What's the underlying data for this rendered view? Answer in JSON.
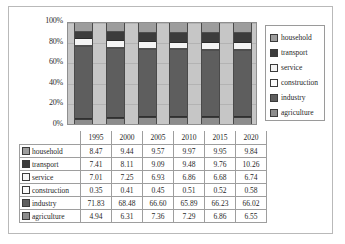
{
  "chart_data": {
    "type": "bar",
    "subtype": "100% stacked column",
    "title": "",
    "xlabel": "",
    "ylabel": "",
    "categories": [
      "1995",
      "2000",
      "2005",
      "2010",
      "2015",
      "2020"
    ],
    "ylim": [
      0,
      100
    ],
    "ytick_labels": [
      "0%",
      "20%",
      "40%",
      "60%",
      "80%",
      "100%"
    ],
    "ytick_values": [
      0,
      20,
      40,
      60,
      80,
      100
    ],
    "grid": true,
    "legend_position": "right",
    "stack_order_bottom_to_top": [
      "agriculture",
      "industry",
      "construction",
      "service",
      "transport",
      "household"
    ],
    "series": [
      {
        "name": "household",
        "color": "#9d9d9d",
        "values": [
          8.47,
          9.44,
          9.57,
          9.97,
          9.95,
          9.84
        ]
      },
      {
        "name": "transport",
        "color": "#3c3c3c",
        "values": [
          7.41,
          8.11,
          9.09,
          9.48,
          9.76,
          10.26
        ]
      },
      {
        "name": "service",
        "color": "#f4f4f4",
        "values": [
          7.01,
          7.25,
          6.93,
          6.86,
          6.68,
          6.74
        ]
      },
      {
        "name": "construction",
        "color": "#fbfbfb",
        "values": [
          0.35,
          0.41,
          0.45,
          0.51,
          0.52,
          0.58
        ]
      },
      {
        "name": "industry",
        "color": "#5e5e5e",
        "values": [
          71.83,
          68.48,
          66.6,
          65.89,
          66.23,
          66.02
        ]
      },
      {
        "name": "agriculture",
        "color": "#8c8c8c",
        "values": [
          4.94,
          6.31,
          7.36,
          7.29,
          6.86,
          6.55
        ]
      }
    ]
  },
  "legend": {
    "items": [
      {
        "label": "household",
        "color": "#9d9d9d"
      },
      {
        "label": "transport",
        "color": "#3c3c3c"
      },
      {
        "label": "service",
        "color": "#f4f4f4"
      },
      {
        "label": "construction",
        "color": "#fbfbfb"
      },
      {
        "label": "industry",
        "color": "#5e5e5e"
      },
      {
        "label": "agriculture",
        "color": "#8c8c8c"
      }
    ]
  },
  "table": {
    "year_headers": [
      "1995",
      "2000",
      "2005",
      "2010",
      "2015",
      "2020"
    ],
    "rows": [
      {
        "label": "household",
        "color": "#9d9d9d",
        "cells": [
          "8.47",
          "9.44",
          "9.57",
          "9.97",
          "9.95",
          "9.84"
        ]
      },
      {
        "label": "transport",
        "color": "#3c3c3c",
        "cells": [
          "7.41",
          "8.11",
          "9.09",
          "9.48",
          "9.76",
          "10.26"
        ]
      },
      {
        "label": "service",
        "color": "#f4f4f4",
        "cells": [
          "7.01",
          "7.25",
          "6.93",
          "6.86",
          "6.68",
          "6.74"
        ]
      },
      {
        "label": "construction",
        "color": "#fbfbfb",
        "cells": [
          "0.35",
          "0.41",
          "0.45",
          "0.51",
          "0.52",
          "0.58"
        ]
      },
      {
        "label": "industry",
        "color": "#5e5e5e",
        "cells": [
          "71.83",
          "68.48",
          "66.60",
          "65.89",
          "66.23",
          "66.02"
        ]
      },
      {
        "label": "agriculture",
        "color": "#8c8c8c",
        "cells": [
          "4.94",
          "6.31",
          "7.36",
          "7.29",
          "6.86",
          "6.55"
        ]
      }
    ]
  },
  "colors": {
    "plot_background": "#c6c6c6",
    "gridline": "#b3b3b3",
    "border": "#9e9e9e"
  }
}
